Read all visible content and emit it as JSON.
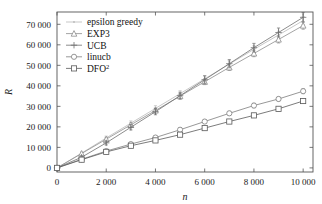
{
  "chart_data": {
    "type": "line",
    "title": "",
    "xlabel": "n",
    "ylabel": "R",
    "xlim": [
      0,
      10400
    ],
    "ylim": [
      -2000,
      76000
    ],
    "grid": false,
    "legend_position": "top-left",
    "xticks": [
      0,
      2000,
      4000,
      6000,
      8000,
      10000
    ],
    "xticklabels": [
      "0",
      "2 000",
      "4 000",
      "6 000",
      "8 000",
      "10 000"
    ],
    "yticks": [
      0,
      10000,
      20000,
      30000,
      40000,
      50000,
      60000,
      70000
    ],
    "yticklabels": [
      "0",
      "10 000",
      "20 000",
      "30 000",
      "40 000",
      "50 000",
      "60 000",
      "70 000"
    ],
    "x": [
      0,
      1000,
      2000,
      3000,
      4000,
      5000,
      6000,
      7000,
      8000,
      9000,
      10000
    ],
    "series": [
      {
        "name": "epsilon greedy",
        "marker": "dot",
        "color": "#b9b9b9",
        "values": [
          0,
          7200,
          14600,
          21800,
          29000,
          36200,
          43400,
          50600,
          57800,
          64800,
          71800
        ],
        "errors": [
          0,
          600,
          900,
          1100,
          1300,
          1400,
          1500,
          1600,
          1700,
          1800,
          1900
        ]
      },
      {
        "name": "EXP3",
        "marker": "triangle",
        "color": "#8d8d8d",
        "values": [
          0,
          7000,
          14000,
          21000,
          28000,
          35000,
          42000,
          49000,
          55800,
          62600,
          69400
        ],
        "errors": [
          0,
          500,
          800,
          1000,
          1200,
          1300,
          1400,
          1500,
          1600,
          1700,
          1800
        ]
      },
      {
        "name": "UCB",
        "marker": "plus",
        "color": "#6e6e6e",
        "values": [
          0,
          5200,
          12200,
          19800,
          27400,
          35200,
          43000,
          50800,
          58600,
          66000,
          73400
        ],
        "errors": [
          0,
          700,
          1000,
          1300,
          1500,
          1700,
          1900,
          2000,
          2100,
          2200,
          2300
        ]
      },
      {
        "name": "linucb",
        "marker": "circle",
        "color": "#7d7d7d",
        "values": [
          0,
          4200,
          8200,
          11600,
          14800,
          18600,
          22600,
          26600,
          30400,
          33600,
          37400
        ],
        "errors": [
          0,
          400,
          600,
          700,
          800,
          900,
          1000,
          1000,
          1100,
          1100,
          1200
        ]
      },
      {
        "name": "DFO2",
        "label": "DFO",
        "superscript": "2",
        "marker": "square",
        "color": "#5a5a5a",
        "values": [
          0,
          4000,
          7800,
          10800,
          13400,
          16200,
          19400,
          22600,
          25600,
          28800,
          32600
        ],
        "errors": [
          0,
          350,
          500,
          600,
          700,
          800,
          850,
          900,
          950,
          1000,
          1050
        ]
      }
    ]
  },
  "legend": {
    "entries": [
      {
        "label": "epsilon greedy"
      },
      {
        "label": "EXP3"
      },
      {
        "label": "UCB"
      },
      {
        "label": "linucb"
      },
      {
        "label": "DFO",
        "superscript": "2"
      }
    ]
  }
}
